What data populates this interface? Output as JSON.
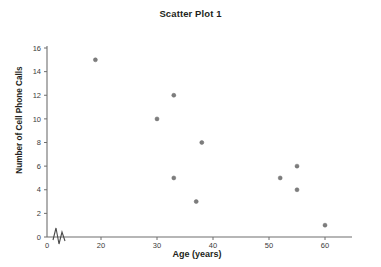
{
  "chart_data": {
    "type": "scatter",
    "title": "Scatter Plot 1",
    "xlabel": "Age (years)",
    "ylabel": "Number of Cell Phone Calls",
    "xlim": [
      0,
      63
    ],
    "ylim": [
      0,
      16
    ],
    "grid": false,
    "legend": null,
    "axis_break": {
      "axis": "x",
      "between": [
        0,
        15
      ],
      "symbol": "zigzag"
    },
    "xticks": [
      0,
      20,
      30,
      40,
      50,
      60
    ],
    "xtick_labels": [
      "0",
      "20",
      "30",
      "40",
      "50",
      "60"
    ],
    "yticks": [
      0,
      2,
      4,
      6,
      8,
      10,
      12,
      14,
      16
    ],
    "ytick_labels": [
      "0",
      "2",
      "4",
      "6",
      "8",
      "10",
      "12",
      "14",
      "16"
    ],
    "marker": {
      "shape": "circle",
      "color": "#7d7d7d",
      "size": 4
    },
    "points": [
      {
        "x": 19,
        "y": 15
      },
      {
        "x": 30,
        "y": 10
      },
      {
        "x": 33,
        "y": 12
      },
      {
        "x": 33,
        "y": 5
      },
      {
        "x": 37,
        "y": 3
      },
      {
        "x": 38,
        "y": 8
      },
      {
        "x": 52,
        "y": 5
      },
      {
        "x": 55,
        "y": 6
      },
      {
        "x": 55,
        "y": 4
      },
      {
        "x": 60,
        "y": 1
      }
    ],
    "series": [
      {
        "name": "Cell phone calls by age",
        "x": [
          19,
          30,
          33,
          33,
          37,
          38,
          52,
          55,
          55,
          60
        ],
        "y": [
          15,
          10,
          12,
          5,
          3,
          8,
          5,
          6,
          4,
          1
        ]
      }
    ]
  },
  "colors": {
    "marker": "#7d7d7d",
    "axis": "#6f6f6f",
    "text": "#231f20",
    "background": "#ffffff"
  }
}
